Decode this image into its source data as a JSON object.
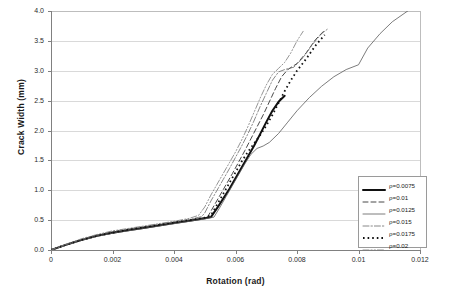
{
  "chart_data": {
    "type": "line",
    "title": "",
    "xlabel": "Rotation (rad)",
    "ylabel": "Crack Width (mm)",
    "xlim": [
      0,
      0.012
    ],
    "ylim": [
      0,
      4.0
    ],
    "xticks": [
      "0",
      "0.002",
      "0.004",
      "0.006",
      "0.008",
      "0.01",
      "0.012"
    ],
    "xtick_values": [
      0,
      0.002,
      0.004,
      0.006,
      0.008,
      0.01,
      0.012
    ],
    "yticks": [
      "0.0",
      "0.5",
      "1.0",
      "1.5",
      "2.0",
      "2.5",
      "3.0",
      "3.5",
      "4.0"
    ],
    "ytick_values": [
      0,
      0.5,
      1.0,
      1.5,
      2.0,
      2.5,
      3.0,
      3.5,
      4.0
    ],
    "grid": "horizontal",
    "legend_position": "lower-right",
    "series": [
      {
        "name": "ρ=0.0075",
        "style": "thick-solid",
        "color": "#111111",
        "points": [
          [
            0,
            0.0
          ],
          [
            0.0005,
            0.09
          ],
          [
            0.001,
            0.17
          ],
          [
            0.0015,
            0.24
          ],
          [
            0.002,
            0.29
          ],
          [
            0.0025,
            0.33
          ],
          [
            0.003,
            0.37
          ],
          [
            0.0035,
            0.41
          ],
          [
            0.004,
            0.45
          ],
          [
            0.0045,
            0.49
          ],
          [
            0.005,
            0.53
          ],
          [
            0.0052,
            0.55
          ],
          [
            0.0054,
            0.7
          ],
          [
            0.0056,
            0.86
          ],
          [
            0.0058,
            1.02
          ],
          [
            0.006,
            1.2
          ],
          [
            0.0062,
            1.38
          ],
          [
            0.0064,
            1.56
          ],
          [
            0.0066,
            1.74
          ],
          [
            0.0068,
            1.94
          ],
          [
            0.007,
            2.14
          ],
          [
            0.0072,
            2.33
          ],
          [
            0.0074,
            2.48
          ],
          [
            0.0076,
            2.58
          ]
        ]
      },
      {
        "name": "ρ=0.01",
        "style": "dashed",
        "color": "#333333",
        "points": [
          [
            0,
            0.0
          ],
          [
            0.0005,
            0.09
          ],
          [
            0.001,
            0.17
          ],
          [
            0.0015,
            0.24
          ],
          [
            0.002,
            0.3
          ],
          [
            0.0025,
            0.34
          ],
          [
            0.003,
            0.38
          ],
          [
            0.0035,
            0.42
          ],
          [
            0.004,
            0.46
          ],
          [
            0.0045,
            0.5
          ],
          [
            0.005,
            0.54
          ],
          [
            0.0051,
            0.56
          ],
          [
            0.0053,
            0.74
          ],
          [
            0.0055,
            0.92
          ],
          [
            0.0057,
            1.1
          ],
          [
            0.0059,
            1.28
          ],
          [
            0.0061,
            1.47
          ],
          [
            0.0063,
            1.66
          ],
          [
            0.0065,
            1.86
          ],
          [
            0.0067,
            2.06
          ],
          [
            0.0069,
            2.26
          ],
          [
            0.0071,
            2.48
          ],
          [
            0.0073,
            2.7
          ],
          [
            0.0075,
            2.9
          ],
          [
            0.0077,
            3.02
          ],
          [
            0.008,
            3.12
          ],
          [
            0.0083,
            3.3
          ],
          [
            0.0086,
            3.52
          ],
          [
            0.0089,
            3.68
          ]
        ]
      },
      {
        "name": "ρ=0.0125",
        "style": "thin-solid",
        "color": "#5a5a5a",
        "points": [
          [
            0,
            0.0
          ],
          [
            0.0005,
            0.08
          ],
          [
            0.001,
            0.16
          ],
          [
            0.0015,
            0.23
          ],
          [
            0.002,
            0.28
          ],
          [
            0.0025,
            0.32
          ],
          [
            0.003,
            0.36
          ],
          [
            0.0035,
            0.4
          ],
          [
            0.004,
            0.44
          ],
          [
            0.0045,
            0.48
          ],
          [
            0.005,
            0.52
          ],
          [
            0.0053,
            0.55
          ],
          [
            0.0055,
            0.72
          ],
          [
            0.0057,
            0.9
          ],
          [
            0.0059,
            1.08
          ],
          [
            0.0061,
            1.26
          ],
          [
            0.0063,
            1.44
          ],
          [
            0.0065,
            1.6
          ],
          [
            0.0067,
            1.7
          ],
          [
            0.0069,
            1.74
          ],
          [
            0.0071,
            1.8
          ],
          [
            0.0074,
            1.95
          ],
          [
            0.0077,
            2.14
          ],
          [
            0.008,
            2.33
          ],
          [
            0.0084,
            2.55
          ],
          [
            0.0088,
            2.74
          ],
          [
            0.0092,
            2.9
          ],
          [
            0.0096,
            3.02
          ],
          [
            0.01,
            3.1
          ],
          [
            0.0103,
            3.38
          ],
          [
            0.0107,
            3.62
          ],
          [
            0.0111,
            3.82
          ],
          [
            0.0116,
            4.0
          ]
        ]
      },
      {
        "name": "ρ=0.015",
        "style": "dash-dot",
        "color": "#6b6b6b",
        "points": [
          [
            0,
            0.0
          ],
          [
            0.0005,
            0.09
          ],
          [
            0.001,
            0.18
          ],
          [
            0.0015,
            0.25
          ],
          [
            0.002,
            0.31
          ],
          [
            0.0025,
            0.35
          ],
          [
            0.003,
            0.39
          ],
          [
            0.0035,
            0.43
          ],
          [
            0.004,
            0.47
          ],
          [
            0.0045,
            0.51
          ],
          [
            0.0049,
            0.56
          ],
          [
            0.005,
            0.62
          ],
          [
            0.0052,
            0.82
          ],
          [
            0.0054,
            1.0
          ],
          [
            0.0056,
            1.18
          ],
          [
            0.0058,
            1.36
          ],
          [
            0.006,
            1.55
          ],
          [
            0.0062,
            1.74
          ],
          [
            0.0064,
            1.94
          ],
          [
            0.0066,
            2.16
          ],
          [
            0.0068,
            2.4
          ],
          [
            0.007,
            2.62
          ],
          [
            0.0072,
            2.84
          ],
          [
            0.0074,
            2.98
          ],
          [
            0.0076,
            3.02
          ],
          [
            0.0079,
            3.06
          ],
          [
            0.0082,
            3.22
          ],
          [
            0.0085,
            3.44
          ],
          [
            0.0088,
            3.62
          ],
          [
            0.009,
            3.7
          ]
        ]
      },
      {
        "name": "ρ=0.0175",
        "style": "dotted",
        "color": "#111111",
        "points": [
          [
            0,
            0.0
          ],
          [
            0.0005,
            0.09
          ],
          [
            0.001,
            0.17
          ],
          [
            0.0015,
            0.24
          ],
          [
            0.002,
            0.29
          ],
          [
            0.0025,
            0.34
          ],
          [
            0.003,
            0.38
          ],
          [
            0.0035,
            0.42
          ],
          [
            0.004,
            0.46
          ],
          [
            0.0045,
            0.5
          ],
          [
            0.005,
            0.54
          ],
          [
            0.0052,
            0.58
          ],
          [
            0.0054,
            0.76
          ],
          [
            0.0056,
            0.94
          ],
          [
            0.0058,
            1.12
          ],
          [
            0.006,
            1.3
          ],
          [
            0.0062,
            1.48
          ],
          [
            0.0064,
            1.64
          ],
          [
            0.0066,
            1.78
          ],
          [
            0.0068,
            1.92
          ],
          [
            0.007,
            2.08
          ],
          [
            0.0072,
            2.26
          ],
          [
            0.0074,
            2.46
          ],
          [
            0.0076,
            2.66
          ],
          [
            0.0078,
            2.84
          ],
          [
            0.008,
            3.0
          ],
          [
            0.0083,
            3.2
          ],
          [
            0.0086,
            3.42
          ],
          [
            0.0089,
            3.6
          ]
        ]
      },
      {
        "name": "ρ=0.02",
        "style": "dash-dot-dot",
        "color": "#7a7a7a",
        "points": [
          [
            0,
            0.0
          ],
          [
            0.0005,
            0.1
          ],
          [
            0.001,
            0.19
          ],
          [
            0.0015,
            0.26
          ],
          [
            0.002,
            0.32
          ],
          [
            0.0025,
            0.36
          ],
          [
            0.003,
            0.4
          ],
          [
            0.0035,
            0.44
          ],
          [
            0.004,
            0.48
          ],
          [
            0.0045,
            0.53
          ],
          [
            0.0048,
            0.58
          ],
          [
            0.005,
            0.72
          ],
          [
            0.0052,
            0.92
          ],
          [
            0.0054,
            1.1
          ],
          [
            0.0056,
            1.28
          ],
          [
            0.0058,
            1.46
          ],
          [
            0.006,
            1.64
          ],
          [
            0.0062,
            1.84
          ],
          [
            0.0064,
            2.06
          ],
          [
            0.0066,
            2.3
          ],
          [
            0.0068,
            2.54
          ],
          [
            0.007,
            2.76
          ],
          [
            0.0072,
            2.94
          ],
          [
            0.0074,
            3.04
          ],
          [
            0.0076,
            3.14
          ],
          [
            0.0078,
            3.3
          ],
          [
            0.008,
            3.5
          ],
          [
            0.0082,
            3.66
          ]
        ]
      }
    ]
  }
}
